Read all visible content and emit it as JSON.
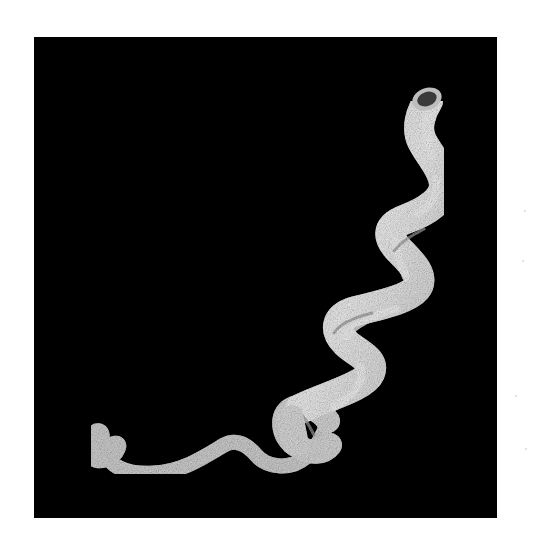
{
  "image": {
    "subject": "spiral-shaped organism on black background",
    "colors": {
      "page_background": "#ffffff",
      "photo_background": "#000000",
      "organism_light": "#e6e6e6",
      "organism_mid": "#bdbdbd",
      "organism_shadow": "#8a8a8a",
      "tip_opening": "#3a3a3a"
    }
  }
}
